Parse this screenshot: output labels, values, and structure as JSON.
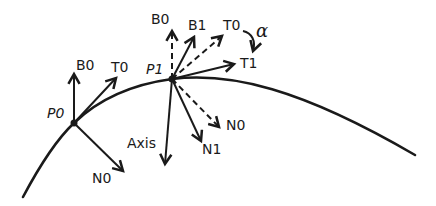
{
  "diagram": {
    "type": "frenet-frame-rotation",
    "colors": {
      "stroke": "#1a1a1a",
      "background": "#ffffff"
    },
    "points": [
      {
        "id": "P0",
        "label": "P0",
        "x": 74,
        "y": 123
      },
      {
        "id": "P1",
        "label": "P1",
        "x": 172,
        "y": 79
      }
    ],
    "vectors_at_P0": [
      {
        "label": "B0",
        "style": "solid",
        "to": [
          74,
          73
        ]
      },
      {
        "label": "T0",
        "style": "solid",
        "to": [
          117,
          77
        ]
      },
      {
        "label": "N0",
        "style": "solid",
        "to": [
          124,
          172
        ]
      }
    ],
    "vectors_at_P1": [
      {
        "label": "B0",
        "style": "dashed",
        "to": [
          172,
          30
        ]
      },
      {
        "label": "B1",
        "style": "solid",
        "to": [
          194,
          36
        ]
      },
      {
        "label": "T0",
        "style": "dashed",
        "to": [
          223,
          35
        ]
      },
      {
        "label": "T1",
        "style": "solid",
        "to": [
          235,
          64
        ]
      },
      {
        "label": "N0",
        "style": "dashed",
        "to": [
          220,
          128
        ]
      },
      {
        "label": "N1",
        "style": "solid",
        "to": [
          202,
          142
        ]
      },
      {
        "label": "Axis",
        "style": "solid",
        "to": [
          165,
          165
        ]
      }
    ],
    "rotation": {
      "label": "α",
      "from": "T0",
      "to": "T1"
    }
  },
  "labels": {
    "p0": "P0",
    "p1": "P1",
    "p0_b0": "B0",
    "p0_t0": "T0",
    "p0_n0": "N0",
    "p1_b0": "B0",
    "p1_b1": "B1",
    "p1_t0": "T0",
    "p1_t1": "T1",
    "p1_n0": "N0",
    "p1_n1": "N1",
    "axis": "Axis",
    "alpha": "α"
  }
}
